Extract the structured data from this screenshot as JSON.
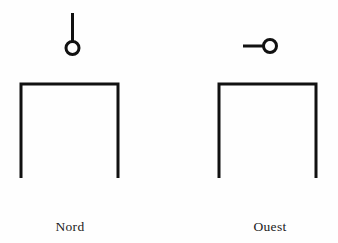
{
  "page": {
    "background_color": "#fefefe",
    "ink_color": "#111111",
    "width": 338,
    "height": 243,
    "caption_font_style": "serif"
  },
  "diagram": {
    "type": "technical-orthographic-views",
    "stroke_color": "#111111",
    "stroke_width": 3,
    "figures": [
      {
        "id": "nord",
        "label": "Nord",
        "label_center_x": 70,
        "label_baseline_y": 231,
        "marker": {
          "kind": "circle-with-stem",
          "semantic": "view-direction-marker-up",
          "circle_center_x": 72.5,
          "circle_center_y": 48,
          "circle_radius": 6.5,
          "stem_orientation": "vertical-up",
          "stem_from_x": 72.5,
          "stem_from_y": 41.5,
          "stem_to_x": 72.5,
          "stem_to_y": 13
        },
        "bracket": {
          "kind": "inverted-u",
          "semantic": "open-bottom-rectangle-profile",
          "left_x": 21,
          "right_x": 118,
          "top_y": 84,
          "bottom_y": 178
        }
      },
      {
        "id": "ouest",
        "label": "Ouest",
        "label_center_x": 270,
        "label_baseline_y": 231,
        "marker": {
          "kind": "circle-with-stem",
          "semantic": "view-direction-marker-left",
          "circle_center_x": 270,
          "circle_center_y": 46,
          "circle_radius": 6.5,
          "stem_orientation": "horizontal-left",
          "stem_from_x": 263.5,
          "stem_from_y": 46,
          "stem_to_x": 243,
          "stem_to_y": 46
        },
        "bracket": {
          "kind": "inverted-u",
          "semantic": "open-bottom-rectangle-profile",
          "left_x": 219,
          "right_x": 316,
          "top_y": 84,
          "bottom_y": 178
        }
      }
    ]
  }
}
